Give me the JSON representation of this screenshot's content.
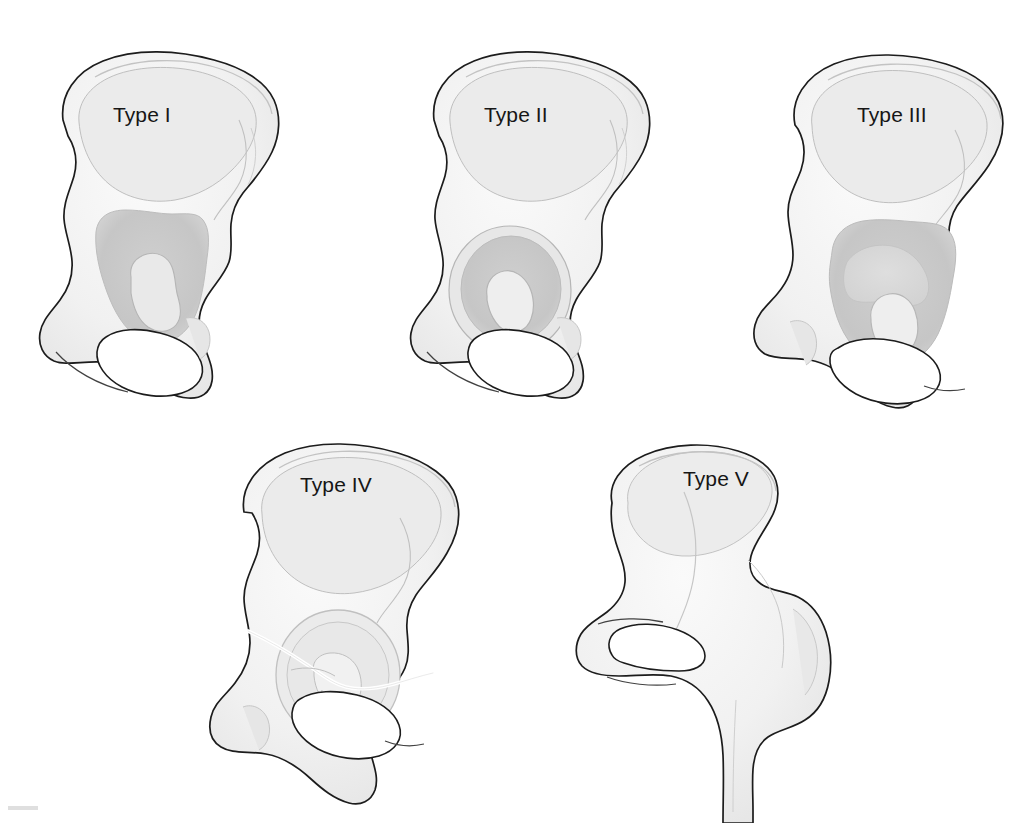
{
  "figure": {
    "background_color": "#ffffff",
    "width": 1030,
    "height": 823,
    "outline_color": "#1c1c1c",
    "bone_fill_color": "#f1f1f1",
    "bone_shadow_color": "#dcdcdc",
    "defect_fill_color": "#c9c9c9",
    "defect_fill_light": "#dadada",
    "fracture_line_color": "#ffffff",
    "label_color": "#161616",
    "corner_artifact_color": "#d9d9d9"
  },
  "specimens": [
    {
      "id": "type-1",
      "label": "Type I",
      "label_x": 113,
      "label_y": 103,
      "row": 1,
      "column": 1,
      "defect": "segmental",
      "has_femur": false,
      "has_fracture_line": false
    },
    {
      "id": "type-2",
      "label": "Type II",
      "label_x": 484,
      "label_y": 103,
      "row": 1,
      "column": 2,
      "defect": "cavitary",
      "has_femur": false,
      "has_fracture_line": false
    },
    {
      "id": "type-3",
      "label": "Type III",
      "label_x": 857,
      "label_y": 103,
      "row": 1,
      "column": 3,
      "defect": "combined-segmental-cavitary",
      "has_femur": false,
      "has_fracture_line": false
    },
    {
      "id": "type-4",
      "label": "Type IV",
      "label_x": 300,
      "label_y": 473,
      "row": 2,
      "column": 1,
      "defect": "pelvic-discontinuity",
      "has_femur": false,
      "has_fracture_line": true
    },
    {
      "id": "type-5",
      "label": "Type V",
      "label_x": 683,
      "label_y": 467,
      "row": 2,
      "column": 2,
      "defect": "arthrodesis",
      "has_femur": true,
      "has_fracture_line": false
    }
  ]
}
